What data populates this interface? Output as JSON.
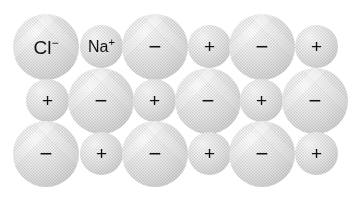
{
  "figure": {
    "name": "sodium-chloride-ionic-lattice",
    "background_color": "#ffffff",
    "sphere_fill_color": "#e3e3e3",
    "sphere_highlight_color": "#fdfdfd",
    "sphere_shadow_color": "#c2c2c2",
    "label_color": "#111111"
  },
  "legend": {
    "anion": {
      "symbol": "Cl",
      "charge": "−",
      "role": "chloride-ion",
      "size": "large"
    },
    "cation": {
      "symbol": "Na",
      "charge": "+",
      "role": "sodium-ion",
      "size": "small"
    }
  },
  "lattice": {
    "rows": [
      {
        "row_index": 1,
        "ions": [
          {
            "type": "anion",
            "label_kind": "formula",
            "symbol": "Cl",
            "charge": "−",
            "x": 13,
            "y": 14,
            "d": 66
          },
          {
            "type": "cation",
            "label_kind": "formula",
            "symbol": "Na",
            "charge": "+",
            "x": 80,
            "y": 25,
            "d": 43
          },
          {
            "type": "anion",
            "label_kind": "sign",
            "sign": "−",
            "x": 122,
            "y": 14,
            "d": 66
          },
          {
            "type": "cation",
            "label_kind": "sign",
            "sign": "+",
            "x": 188,
            "y": 25,
            "d": 43
          },
          {
            "type": "anion",
            "label_kind": "sign",
            "sign": "−",
            "x": 229,
            "y": 14,
            "d": 66
          },
          {
            "type": "cation",
            "label_kind": "sign",
            "sign": "+",
            "x": 295,
            "y": 25,
            "d": 43
          }
        ]
      },
      {
        "row_index": 2,
        "ions": [
          {
            "type": "cation",
            "label_kind": "sign",
            "sign": "+",
            "x": 26,
            "y": 79,
            "d": 43
          },
          {
            "type": "anion",
            "label_kind": "sign",
            "sign": "−",
            "x": 68,
            "y": 68,
            "d": 66
          },
          {
            "type": "cation",
            "label_kind": "sign",
            "sign": "+",
            "x": 133,
            "y": 79,
            "d": 43
          },
          {
            "type": "anion",
            "label_kind": "sign",
            "sign": "−",
            "x": 175,
            "y": 68,
            "d": 66
          },
          {
            "type": "cation",
            "label_kind": "sign",
            "sign": "+",
            "x": 240,
            "y": 79,
            "d": 43
          },
          {
            "type": "anion",
            "label_kind": "sign",
            "sign": "−",
            "x": 282,
            "y": 68,
            "d": 66
          }
        ]
      },
      {
        "row_index": 3,
        "ions": [
          {
            "type": "anion",
            "label_kind": "sign",
            "sign": "−",
            "x": 13,
            "y": 121,
            "d": 66
          },
          {
            "type": "cation",
            "label_kind": "sign",
            "sign": "+",
            "x": 80,
            "y": 132,
            "d": 43
          },
          {
            "type": "anion",
            "label_kind": "sign",
            "sign": "−",
            "x": 122,
            "y": 121,
            "d": 66
          },
          {
            "type": "cation",
            "label_kind": "sign",
            "sign": "+",
            "x": 188,
            "y": 132,
            "d": 43
          },
          {
            "type": "anion",
            "label_kind": "sign",
            "sign": "−",
            "x": 229,
            "y": 121,
            "d": 66
          },
          {
            "type": "cation",
            "label_kind": "sign",
            "sign": "+",
            "x": 295,
            "y": 132,
            "d": 43
          }
        ]
      }
    ]
  }
}
